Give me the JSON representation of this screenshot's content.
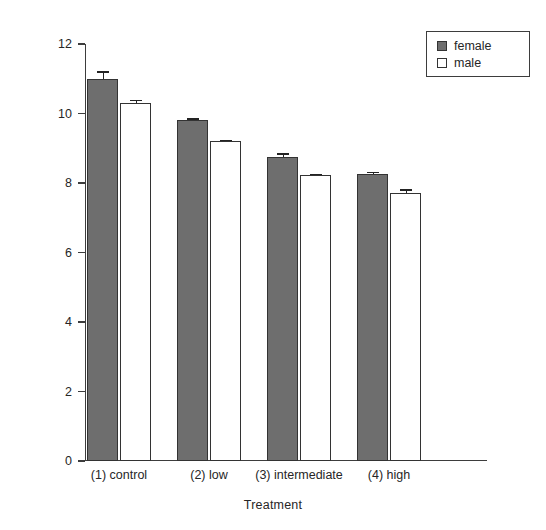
{
  "chart_data": {
    "type": "bar",
    "title": "",
    "xlabel": "Treatment",
    "ylabel": "Response",
    "categories": [
      "(1) control",
      "(2) low",
      "(3) intermediate",
      "(4) high"
    ],
    "series": [
      {
        "name": "female",
        "color": "#6e6e6e",
        "values": [
          11.0,
          9.8,
          8.75,
          8.27
        ],
        "errors": [
          0.22,
          0.07,
          0.1,
          0.05
        ]
      },
      {
        "name": "male",
        "color": "#ffffff",
        "values": [
          10.3,
          9.2,
          8.22,
          7.7
        ],
        "errors": [
          0.1,
          0.05,
          0.05,
          0.12
        ]
      }
    ],
    "ylim": [
      0,
      12
    ],
    "yticks": [
      0,
      2,
      4,
      6,
      8,
      10,
      12
    ],
    "yticklabels": [
      "0",
      "2",
      "4",
      "6",
      "8",
      "10",
      "12"
    ],
    "grid": false,
    "legend_position": "top-right",
    "legend_entries": [
      "female",
      "male"
    ]
  }
}
